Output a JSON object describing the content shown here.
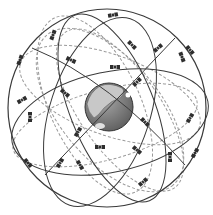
{
  "diagram": {
    "colors": {
      "orbit_solid": "#3a3a3a",
      "orbit_dashed": "#9a9a9a",
      "earth_ocean": "#7d7d7d",
      "earth_land": "#c4c4c4",
      "satellite": "#2e2e2e",
      "background": "#ffffff"
    },
    "earth": {
      "cx": 109,
      "cy": 107,
      "r": 24
    },
    "outer_sphere": {
      "cx": 107,
      "cy": 108,
      "r": 99
    },
    "satellites": [
      {
        "x": 113,
        "y": 15,
        "rot": -10
      },
      {
        "x": 53,
        "y": 35,
        "rot": -70
      },
      {
        "x": 20,
        "y": 60,
        "rot": -70
      },
      {
        "x": 71,
        "y": 60,
        "rot": 25
      },
      {
        "x": 115,
        "y": 67,
        "rot": 0
      },
      {
        "x": 132,
        "y": 45,
        "rot": 45
      },
      {
        "x": 158,
        "y": 48,
        "rot": -40
      },
      {
        "x": 182,
        "y": 57,
        "rot": 70
      },
      {
        "x": 190,
        "y": 50,
        "rot": 50
      },
      {
        "x": 137,
        "y": 82,
        "rot": -45
      },
      {
        "x": 65,
        "y": 93,
        "rot": 40
      },
      {
        "x": 22,
        "y": 100,
        "rot": -30
      },
      {
        "x": 30,
        "y": 117,
        "rot": 90
      },
      {
        "x": 190,
        "y": 118,
        "rot": -60
      },
      {
        "x": 78,
        "y": 132,
        "rot": -60
      },
      {
        "x": 100,
        "y": 147,
        "rot": 0
      },
      {
        "x": 145,
        "y": 122,
        "rot": 45
      },
      {
        "x": 137,
        "y": 150,
        "rot": 40
      },
      {
        "x": 170,
        "y": 157,
        "rot": 90
      },
      {
        "x": 195,
        "y": 153,
        "rot": -60
      },
      {
        "x": 28,
        "y": 163,
        "rot": 50
      },
      {
        "x": 60,
        "y": 163,
        "rot": -60
      },
      {
        "x": 80,
        "y": 165,
        "rot": 60
      },
      {
        "x": 143,
        "y": 182,
        "rot": -40
      }
    ]
  }
}
